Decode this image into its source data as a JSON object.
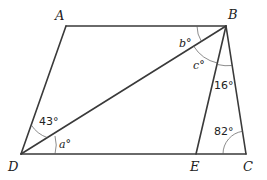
{
  "diagram": {
    "type": "geometry",
    "vertices": {
      "A": {
        "label": "A"
      },
      "B": {
        "label": "B"
      },
      "C": {
        "label": "C"
      },
      "D": {
        "label": "D"
      },
      "E": {
        "label": "E"
      }
    },
    "segments": [
      "AB",
      "BC",
      "CD",
      "DA",
      "BD",
      "BE"
    ],
    "angles": {
      "ADB": {
        "label": "43°"
      },
      "BDC": {
        "label": "a°"
      },
      "ABD": {
        "label": "b°"
      },
      "DBE": {
        "label": "c°"
      },
      "EBC": {
        "label": "16°"
      },
      "BCE": {
        "label": "82°"
      }
    }
  }
}
